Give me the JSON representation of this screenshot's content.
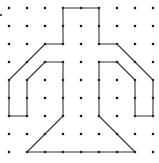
{
  "diagram": {
    "type": "dot-grid-figure",
    "grid": {
      "columns": 9,
      "rows": 9,
      "origin_x": 9,
      "origin_y": 8,
      "spacing": 18,
      "dot_color": "#111111",
      "dot_radius": 1.3
    },
    "stray_dot": {
      "x": 1,
      "y": 15
    },
    "shape": {
      "stroke_color": "#333333",
      "stroke_width": 1.1,
      "vertices_grid": [
        [
          3,
          0
        ],
        [
          5,
          0
        ],
        [
          5,
          2
        ],
        [
          6,
          2
        ],
        [
          8,
          4
        ],
        [
          8,
          6
        ],
        [
          7,
          6
        ],
        [
          7,
          4
        ],
        [
          6,
          3
        ],
        [
          5,
          3
        ],
        [
          5,
          6
        ],
        [
          7,
          8
        ],
        [
          1,
          8
        ],
        [
          3,
          6
        ],
        [
          3,
          3
        ],
        [
          2,
          3
        ],
        [
          1,
          4
        ],
        [
          1,
          6
        ],
        [
          0,
          6
        ],
        [
          0,
          4
        ],
        [
          2,
          2
        ],
        [
          3,
          2
        ]
      ]
    }
  }
}
